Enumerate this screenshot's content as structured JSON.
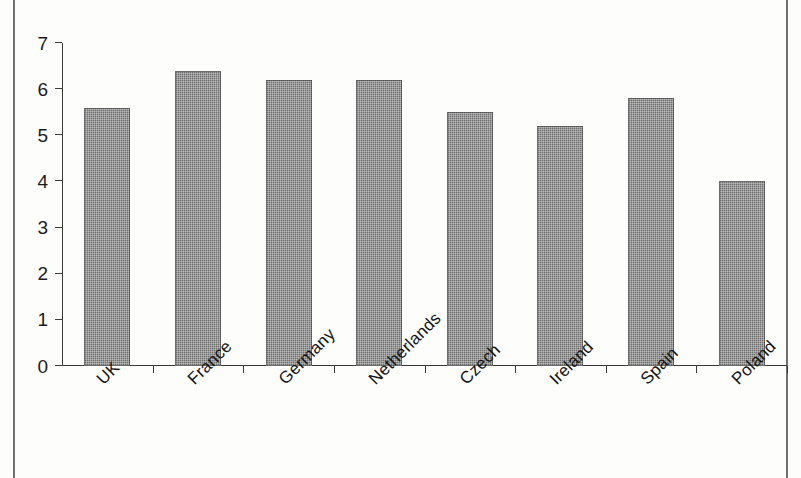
{
  "figure": {
    "background_color": "#fdfdfc",
    "frame_color": "#4a4a4a",
    "axis_color": "#3a3a3a",
    "bar_color": "#6f6f6f"
  },
  "chart_data": {
    "type": "bar",
    "title": "",
    "subtitle": "",
    "xlabel": "",
    "ylabel": "",
    "categories": [
      "UK",
      "France",
      "Germany",
      "Netherlands",
      "Czech",
      "Ireland",
      "Spain",
      "Poland"
    ],
    "values": [
      5.6,
      6.4,
      6.2,
      6.2,
      5.5,
      5.2,
      5.8,
      4.0
    ],
    "ylim": [
      0,
      7
    ],
    "yticks": [
      0,
      1,
      2,
      3,
      4,
      5,
      6,
      7
    ],
    "ytick_labels": [
      "0",
      "1",
      "2",
      "3",
      "4",
      "5",
      "6",
      "7"
    ],
    "grid": false,
    "legend": null,
    "legend_position": "none",
    "series": [
      {
        "name": "",
        "values": [
          5.6,
          6.4,
          6.2,
          6.2,
          5.5,
          5.2,
          5.8,
          4.0
        ]
      }
    ],
    "annotations": [],
    "xtick_label_rotation": -45
  }
}
